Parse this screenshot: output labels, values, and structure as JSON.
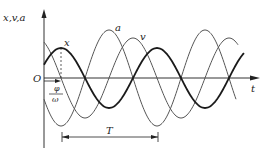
{
  "diagram": {
    "axes": {
      "y_label": "x,v,a",
      "x_label": "t",
      "origin_label": "O"
    },
    "curves": [
      {
        "name": "x",
        "label": "x",
        "amplitude_px": 30,
        "phase_peak_px": 61,
        "stroke": "#1a1a1a",
        "width": 1.8
      },
      {
        "name": "v",
        "label": "v",
        "amplitude_px": 40,
        "phase_peak_px": 37,
        "stroke": "#555555",
        "width": 1.0
      },
      {
        "name": "a",
        "label": "a",
        "amplitude_px": 48,
        "phase_peak_px": 13,
        "stroke": "#555555",
        "width": 1.0
      }
    ],
    "annotations": {
      "phase_numerator": "φ",
      "phase_denominator": "ω",
      "period_label": "T"
    },
    "colors": {
      "axis": "#333333",
      "bold_curve": "#1a1a1a",
      "thin_curve": "#555555"
    }
  }
}
